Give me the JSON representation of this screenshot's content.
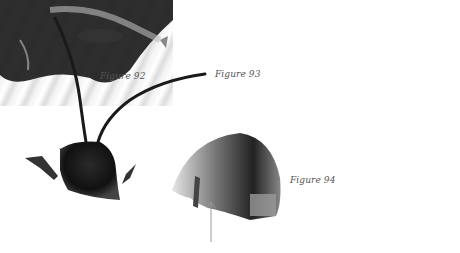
{
  "figures": [
    {
      "id": "fig92",
      "caption": "Figure 92",
      "subject": "bee head with long antennae, dorsal view"
    },
    {
      "id": "fig93",
      "caption": "Figure 93",
      "subject": "close-up of hairy bee leg"
    },
    {
      "id": "fig94",
      "caption": "Figure 94",
      "subject": "bee head side view with arrow pointing to mouthpart"
    }
  ],
  "colors": {
    "background": "#ffffff",
    "caption": "#555555",
    "arrow": "#999999"
  }
}
